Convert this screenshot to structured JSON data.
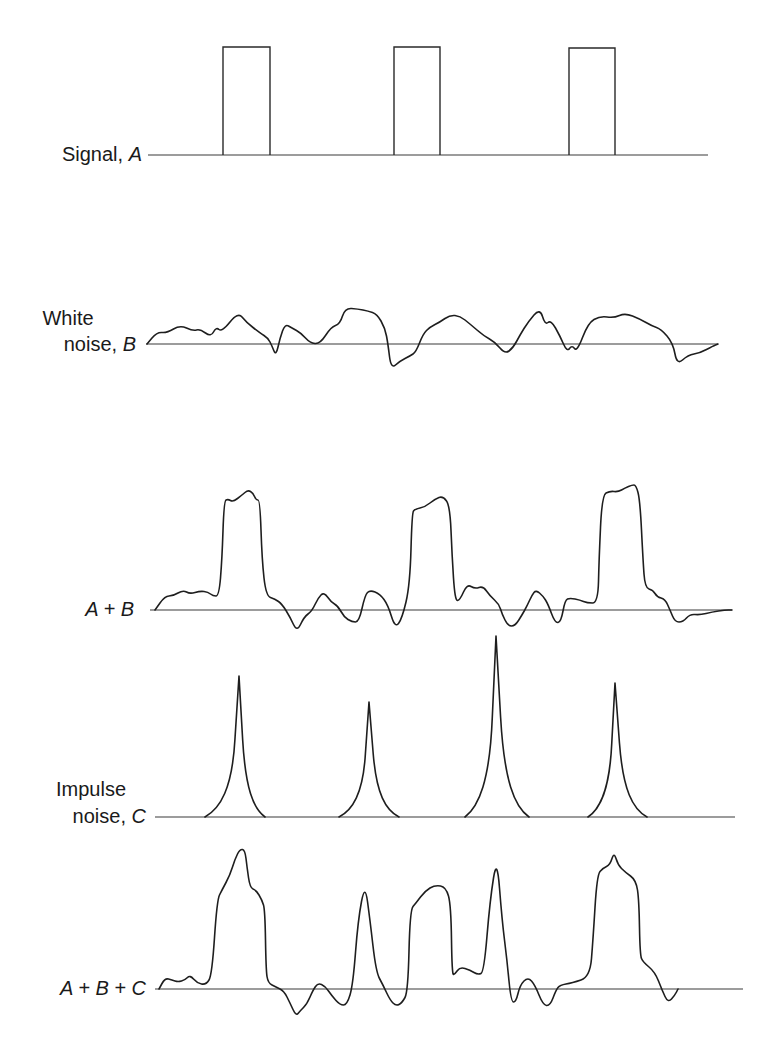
{
  "figure": {
    "panels": [
      {
        "id": "signal",
        "label_text": "Signal, ",
        "label_var": "A",
        "label_line2": "",
        "label_var2": ""
      },
      {
        "id": "white_noise",
        "label_text": "White",
        "label_var": "",
        "label_line2": "noise, ",
        "label_var2": "B"
      },
      {
        "id": "a_plus_b",
        "label_text": "",
        "label_var": "A + B",
        "label_line2": "",
        "label_var2": ""
      },
      {
        "id": "impulse_noise",
        "label_text": "Impulse",
        "label_var": "",
        "label_line2": "noise, ",
        "label_var2": "C"
      },
      {
        "id": "a_plus_b_plus_c",
        "label_text": "",
        "label_var": "A + B + C",
        "label_line2": "",
        "label_var2": ""
      }
    ]
  },
  "chart_data": {
    "type": "line",
    "title": "",
    "xlabel": "",
    "ylabel": "",
    "grid": false,
    "legend": "none",
    "series": [
      {
        "name": "Signal, A",
        "baseline": {
          "y": 155,
          "x0": 148,
          "x1": 708
        },
        "pulses": [
          {
            "x0": 223,
            "x1": 270,
            "top": 47
          },
          {
            "x0": 394,
            "x1": 440,
            "top": 47
          },
          {
            "x0": 569,
            "x1": 615,
            "top": 48
          }
        ]
      },
      {
        "name": "White noise, B",
        "baseline": {
          "y": 344,
          "x0": 146,
          "x1": 718
        },
        "points": [
          [
            147,
            344
          ],
          [
            157,
            332
          ],
          [
            167,
            333
          ],
          [
            180,
            325
          ],
          [
            193,
            331
          ],
          [
            200,
            329
          ],
          [
            211,
            337
          ],
          [
            216,
            327
          ],
          [
            222,
            332
          ],
          [
            238,
            312
          ],
          [
            246,
            322
          ],
          [
            260,
            333
          ],
          [
            268,
            338
          ],
          [
            272,
            346
          ],
          [
            276,
            356
          ],
          [
            280,
            338
          ],
          [
            285,
            324
          ],
          [
            292,
            328
          ],
          [
            301,
            333
          ],
          [
            310,
            343
          ],
          [
            320,
            344
          ],
          [
            331,
            327
          ],
          [
            340,
            324
          ],
          [
            345,
            308
          ],
          [
            358,
            309
          ],
          [
            368,
            311
          ],
          [
            377,
            314
          ],
          [
            385,
            328
          ],
          [
            388,
            344
          ],
          [
            391,
            369
          ],
          [
            400,
            361
          ],
          [
            410,
            356
          ],
          [
            416,
            352
          ],
          [
            423,
            334
          ],
          [
            430,
            327
          ],
          [
            440,
            322
          ],
          [
            450,
            315
          ],
          [
            460,
            316
          ],
          [
            470,
            324
          ],
          [
            484,
            336
          ],
          [
            495,
            342
          ],
          [
            505,
            354
          ],
          [
            513,
            348
          ],
          [
            520,
            335
          ],
          [
            528,
            322
          ],
          [
            540,
            308
          ],
          [
            545,
            325
          ],
          [
            551,
            320
          ],
          [
            560,
            336
          ],
          [
            567,
            352
          ],
          [
            572,
            345
          ],
          [
            577,
            352
          ],
          [
            588,
            323
          ],
          [
            600,
            316
          ],
          [
            614,
            318
          ],
          [
            625,
            313
          ],
          [
            640,
            319
          ],
          [
            652,
            326
          ],
          [
            661,
            329
          ],
          [
            673,
            343
          ],
          [
            677,
            365
          ],
          [
            688,
            355
          ],
          [
            700,
            353
          ],
          [
            713,
            346
          ],
          [
            718,
            344
          ]
        ]
      },
      {
        "name": "A + B",
        "baseline": {
          "y": 610,
          "x0": 150,
          "x1": 732
        },
        "points": [
          [
            155,
            610
          ],
          [
            165,
            596
          ],
          [
            173,
            596
          ],
          [
            183,
            590
          ],
          [
            190,
            594
          ],
          [
            200,
            591
          ],
          [
            208,
            592
          ],
          [
            213,
            596
          ],
          [
            219,
            596
          ],
          [
            222,
            560
          ],
          [
            224,
            501
          ],
          [
            228,
            499
          ],
          [
            233,
            502
          ],
          [
            242,
            495
          ],
          [
            248,
            490
          ],
          [
            253,
            493
          ],
          [
            256,
            500
          ],
          [
            260,
            500
          ],
          [
            262,
            560
          ],
          [
            266,
            596
          ],
          [
            275,
            599
          ],
          [
            282,
            604
          ],
          [
            290,
            617
          ],
          [
            297,
            632
          ],
          [
            304,
            617
          ],
          [
            312,
            611
          ],
          [
            318,
            598
          ],
          [
            324,
            592
          ],
          [
            331,
            602
          ],
          [
            338,
            606
          ],
          [
            344,
            617
          ],
          [
            352,
            622
          ],
          [
            359,
            622
          ],
          [
            365,
            595
          ],
          [
            370,
            590
          ],
          [
            380,
            594
          ],
          [
            388,
            605
          ],
          [
            395,
            628
          ],
          [
            402,
            619
          ],
          [
            410,
            585
          ],
          [
            412,
            513
          ],
          [
            415,
            509
          ],
          [
            425,
            507
          ],
          [
            435,
            499
          ],
          [
            443,
            496
          ],
          [
            450,
            506
          ],
          [
            452,
            555
          ],
          [
            455,
            601
          ],
          [
            460,
            600
          ],
          [
            467,
            584
          ],
          [
            475,
            589
          ],
          [
            483,
            586
          ],
          [
            490,
            596
          ],
          [
            499,
            604
          ],
          [
            502,
            614
          ],
          [
            508,
            626
          ],
          [
            515,
            626
          ],
          [
            522,
            615
          ],
          [
            527,
            606
          ],
          [
            532,
            595
          ],
          [
            536,
            590
          ],
          [
            543,
            596
          ],
          [
            548,
            604
          ],
          [
            555,
            623
          ],
          [
            561,
            622
          ],
          [
            565,
            600
          ],
          [
            570,
            598
          ],
          [
            580,
            600
          ],
          [
            587,
            603
          ],
          [
            598,
            603
          ],
          [
            599,
            560
          ],
          [
            602,
            495
          ],
          [
            610,
            491
          ],
          [
            618,
            492
          ],
          [
            625,
            488
          ],
          [
            632,
            485
          ],
          [
            636,
            485
          ],
          [
            640,
            500
          ],
          [
            643,
            560
          ],
          [
            645,
            588
          ],
          [
            653,
            590
          ],
          [
            657,
            597
          ],
          [
            665,
            599
          ],
          [
            670,
            610
          ],
          [
            675,
            622
          ],
          [
            683,
            622
          ],
          [
            690,
            614
          ],
          [
            700,
            615
          ],
          [
            712,
            612
          ],
          [
            725,
            610
          ],
          [
            732,
            610
          ]
        ]
      },
      {
        "name": "Impulse noise, C",
        "baseline": {
          "y": 817,
          "x0": 155,
          "x1": 735
        },
        "impulses": [
          {
            "x0": 205,
            "peak_x": 239,
            "x1": 265,
            "peak_y": 676
          },
          {
            "x0": 339,
            "peak_x": 369,
            "x1": 399,
            "peak_y": 702
          },
          {
            "x0": 465,
            "peak_x": 496,
            "x1": 529,
            "peak_y": 636
          },
          {
            "x0": 588,
            "peak_x": 615,
            "x1": 647,
            "peak_y": 683
          }
        ]
      },
      {
        "name": "A + B + C",
        "baseline": {
          "y": 989,
          "x0": 155,
          "x1": 743
        },
        "points": [
          [
            159,
            989
          ],
          [
            165,
            978
          ],
          [
            172,
            980
          ],
          [
            178,
            982
          ],
          [
            185,
            980
          ],
          [
            190,
            975
          ],
          [
            197,
            983
          ],
          [
            206,
            985
          ],
          [
            212,
            975
          ],
          [
            217,
            900
          ],
          [
            222,
            890
          ],
          [
            230,
            875
          ],
          [
            235,
            859
          ],
          [
            240,
            849
          ],
          [
            245,
            850
          ],
          [
            247,
            867
          ],
          [
            250,
            888
          ],
          [
            256,
            890
          ],
          [
            262,
            900
          ],
          [
            265,
            910
          ],
          [
            266,
            970
          ],
          [
            268,
            983
          ],
          [
            276,
            987
          ],
          [
            284,
            991
          ],
          [
            290,
            1003
          ],
          [
            296,
            1016
          ],
          [
            300,
            1011
          ],
          [
            307,
            1004
          ],
          [
            313,
            990
          ],
          [
            318,
            983
          ],
          [
            325,
            986
          ],
          [
            332,
            996
          ],
          [
            340,
            1005
          ],
          [
            347,
            1005
          ],
          [
            353,
            985
          ],
          [
            358,
            920
          ],
          [
            365,
            883
          ],
          [
            370,
            920
          ],
          [
            376,
            972
          ],
          [
            383,
            985
          ],
          [
            390,
            1000
          ],
          [
            396,
            1006
          ],
          [
            402,
            1003
          ],
          [
            408,
            992
          ],
          [
            410,
            910
          ],
          [
            416,
            903
          ],
          [
            425,
            891
          ],
          [
            435,
            885
          ],
          [
            446,
            887
          ],
          [
            451,
            905
          ],
          [
            452,
            975
          ],
          [
            455,
            974
          ],
          [
            460,
            967
          ],
          [
            470,
            970
          ],
          [
            478,
            975
          ],
          [
            484,
            972
          ],
          [
            490,
            900
          ],
          [
            497,
            856
          ],
          [
            502,
            920
          ],
          [
            507,
            960
          ],
          [
            511,
            1002
          ],
          [
            516,
            1002
          ],
          [
            520,
            985
          ],
          [
            528,
            977
          ],
          [
            535,
            985
          ],
          [
            543,
            1005
          ],
          [
            550,
            1006
          ],
          [
            556,
            990
          ],
          [
            560,
            985
          ],
          [
            572,
            983
          ],
          [
            590,
            977
          ],
          [
            593,
            940
          ],
          [
            597,
            875
          ],
          [
            603,
            868
          ],
          [
            610,
            865
          ],
          [
            614,
            852
          ],
          [
            618,
            865
          ],
          [
            625,
            872
          ],
          [
            636,
            880
          ],
          [
            639,
            900
          ],
          [
            640,
            955
          ],
          [
            643,
            962
          ],
          [
            655,
            972
          ],
          [
            662,
            990
          ],
          [
            668,
            1003
          ],
          [
            675,
            995
          ],
          [
            678,
            989
          ]
        ]
      }
    ]
  }
}
